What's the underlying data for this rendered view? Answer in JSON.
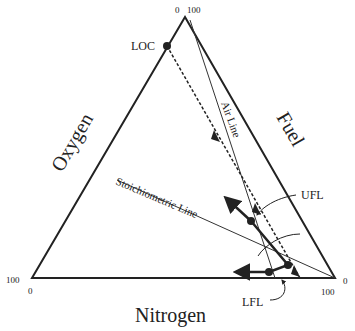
{
  "diagram": {
    "type": "ternary flammability diagram",
    "axes": {
      "oxygen": "Oxygen",
      "fuel": "Fuel",
      "nitrogen": "Nitrogen"
    },
    "ticks": {
      "top_left": "0",
      "top_right": "100",
      "left_top": "100",
      "left_bottom": "0",
      "right_top": "0",
      "right_bottom": "100"
    },
    "lines": {
      "air": "Air Line",
      "stoich": "Stoichiometric Line"
    },
    "points": {
      "loc": "LOC",
      "ufl": "UFL",
      "lfl": "LFL"
    }
  }
}
